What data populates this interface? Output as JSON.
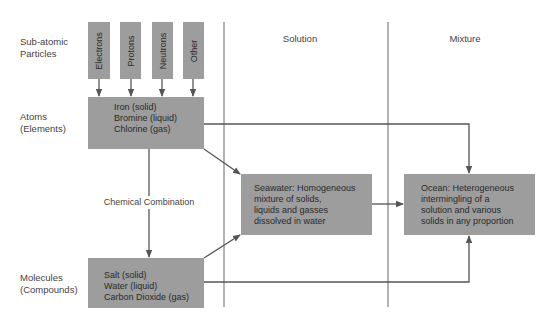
{
  "rows": {
    "subatomic": "Sub-atomic\nParticles",
    "subatomic_l1": "Sub-atomic",
    "subatomic_l2": "Particles",
    "atoms_l1": "Atoms",
    "atoms_l2": "(Elements)",
    "molecules_l1": "Molecules",
    "molecules_l2": "(Compounds)"
  },
  "columns": {
    "solution": "Solution",
    "mixture": "Mixture"
  },
  "particles": [
    "Electrons",
    "Protons",
    "Neutrons",
    "Other"
  ],
  "atoms_box": {
    "line1": "Iron (solid)",
    "line2": "Bromine (liquid)",
    "line3": "Chlorine (gas)"
  },
  "molecules_box": {
    "line1": "Salt (solid)",
    "line2": "Water (liquid)",
    "line3": "Carbon Dioxide (gas)"
  },
  "seawater_box": {
    "line1": "Seawater:  Homogeneous",
    "line2": "mixture of solids,",
    "line3": "liquids and gasses",
    "line4": "dissolved in water"
  },
  "ocean_box": {
    "line1": "Ocean:  Heterogeneous",
    "line2": "intermingling of a",
    "line3": "solution and various",
    "line4": "solids in any proportion"
  },
  "chemical_combination": "Chemical Combination",
  "colors": {
    "box_fill": "#9d9d9d",
    "line": "#555555",
    "text": "#3a3a3a"
  }
}
